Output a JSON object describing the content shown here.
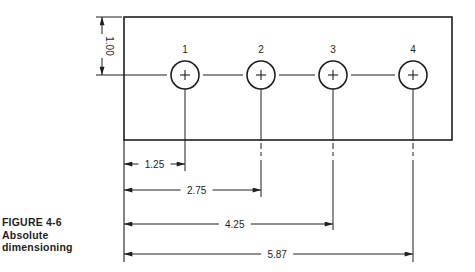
{
  "figure": {
    "number": "FIGURE 4-6",
    "title_line1": "Absolute",
    "title_line2": "dimensioning"
  },
  "colors": {
    "ink": "#1e1e1e",
    "background": "#ffffff"
  },
  "part": {
    "rect": {
      "x": 124,
      "y": 17,
      "width": 328,
      "height": 123
    },
    "centerline_y": 75,
    "hole_radius": 14
  },
  "holes": [
    {
      "label": "1",
      "cx": 185
    },
    {
      "label": "2",
      "cx": 261
    },
    {
      "label": "3",
      "cx": 333
    },
    {
      "label": "4",
      "cx": 413
    }
  ],
  "vertical_dimension": {
    "value": "1.00",
    "x": 102,
    "top_y": 17,
    "bottom_y": 75
  },
  "horizontal_dimensions": [
    {
      "value": "1.25",
      "hole": 1,
      "y": 164,
      "end_x": 185,
      "ext_end_y": 171
    },
    {
      "value": "2.75",
      "hole": 2,
      "y": 190,
      "end_x": 261,
      "ext_end_y": 197
    },
    {
      "value": "4.25",
      "hole": 3,
      "y": 224,
      "end_x": 333,
      "ext_end_y": 230
    },
    {
      "value": "5.87",
      "hole": 4,
      "y": 254,
      "end_x": 413,
      "ext_end_y": 262
    }
  ],
  "datum_line": {
    "x": 124,
    "from_y": 140,
    "to_y": 262
  }
}
